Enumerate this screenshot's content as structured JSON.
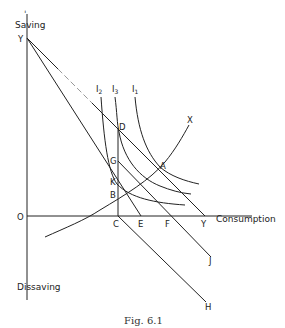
{
  "figure": {
    "caption": "Fig. 6.1",
    "axes": {
      "y_top_label": "Saving",
      "y_bottom_label": "Dissaving",
      "x_label": "Consumption",
      "origin_label": "O"
    },
    "points": {
      "Y_vertical": "Y",
      "Y_horizontal": "Y",
      "A": "A",
      "B": "B",
      "C": "C",
      "D": "D",
      "E": "E",
      "F": "F",
      "G": "G",
      "H": "H",
      "J": "J",
      "K": "K",
      "X": "X"
    },
    "indifference_curves": [
      {
        "name": "I",
        "sub": "2"
      },
      {
        "name": "I",
        "sub": "3"
      },
      {
        "name": "I",
        "sub": "1"
      }
    ],
    "lines": [
      {
        "from": "Y",
        "to": "Y",
        "desc": "budget line through D and A"
      },
      {
        "from": "Y",
        "to": "E",
        "desc": "steeper line through K"
      },
      {
        "from": "G",
        "to": "J",
        "desc": "line through F"
      },
      {
        "from": "C",
        "to": "H",
        "desc": "line below axis"
      },
      {
        "from": "D",
        "to": "C",
        "desc": "vertical line"
      },
      {
        "from": "origin-left",
        "to": "X",
        "desc": "curve through B and A"
      }
    ]
  }
}
